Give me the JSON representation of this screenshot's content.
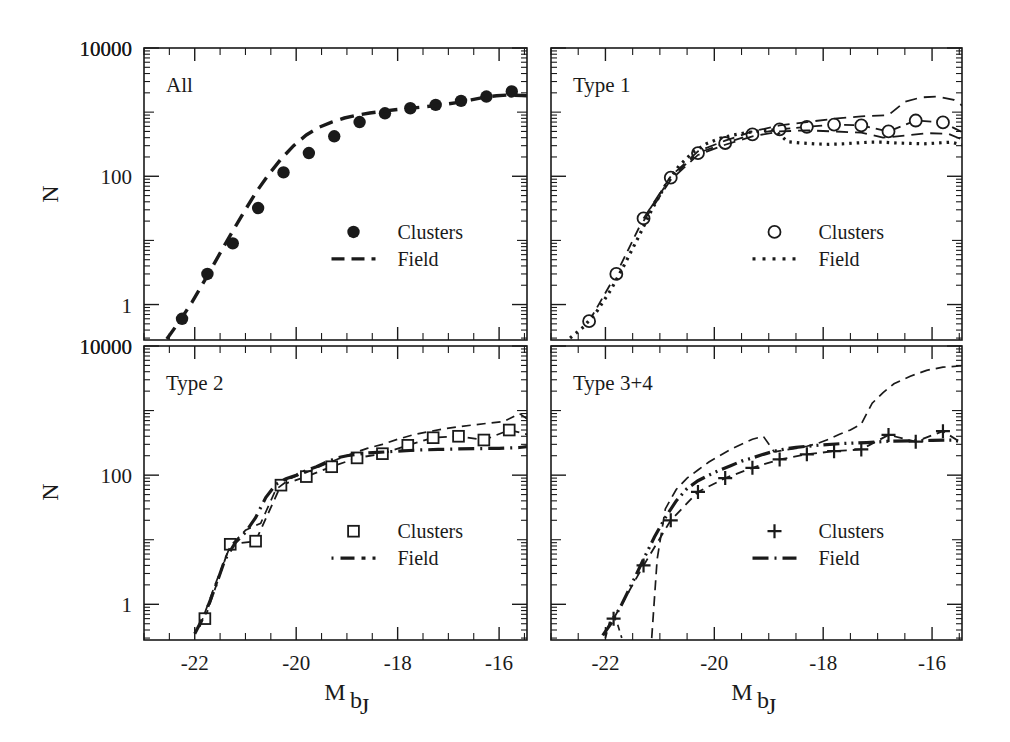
{
  "figure": {
    "title": "",
    "background": "#ffffff",
    "ink_color": "#1a1a1a",
    "width": 1010,
    "height": 742
  },
  "axes": {
    "xlabel_main": "M",
    "xlabel_sub": "b",
    "xlabel_subsub": "J",
    "ylabel": "N",
    "x_ticks": [
      "-22",
      "-20",
      "-18",
      "-16"
    ],
    "x_tick_values": [
      -22,
      -20,
      -18,
      -16
    ],
    "y_ticks": [
      "10000",
      "100",
      "1"
    ],
    "y_tick_values": [
      10000,
      100,
      1
    ],
    "y_top_label": "10000",
    "xlim": [
      -23.0,
      -15.45
    ],
    "ylim": [
      0.28,
      10000
    ],
    "yscale": "log",
    "xscale": "linear",
    "grid": false
  },
  "legend_labels": {
    "clusters": "Clusters",
    "field": "Field"
  },
  "chart_data": {
    "type": "line",
    "xlabel": "M_bJ",
    "ylabel": "N",
    "xlim": [
      -23.0,
      -15.45
    ],
    "ylim": [
      0.28,
      10000
    ],
    "yscale": "log",
    "grid": false,
    "legend_position": "center-right inside each panel",
    "panels": [
      {
        "id": "all",
        "label": "All",
        "position": "top-left",
        "series": [
          {
            "name": "Clusters",
            "kind": "scatter",
            "marker": "filled-circle",
            "x": [
              -22.25,
              -21.75,
              -21.25,
              -20.75,
              -20.25,
              -19.75,
              -19.25,
              -18.75,
              -18.25,
              -17.75,
              -17.25,
              -16.75,
              -16.25,
              -15.75,
              -15.25
            ],
            "y": [
              0.6,
              3.0,
              9.0,
              32.0,
              115.0,
              230.0,
              420.0,
              700.0,
              960.0,
              1150.0,
              1300.0,
              1500.0,
              1750.0,
              2100.0,
              2400.0
            ]
          },
          {
            "name": "Field",
            "kind": "line",
            "linestyle": "dashed",
            "dasharray": "14,8",
            "linewidth": 3.4,
            "x": [
              -22.55,
              -22.3,
              -22.05,
              -21.8,
              -21.55,
              -21.3,
              -21.05,
              -20.8,
              -20.55,
              -20.3,
              -20.05,
              -19.8,
              -19.55,
              -19.3,
              -19.05,
              -18.8,
              -18.55,
              -18.3,
              -18.05,
              -17.8,
              -17.55,
              -17.3,
              -17.05,
              -16.8,
              -16.55,
              -16.3,
              -16.05,
              -15.8,
              -15.55,
              -15.3
            ],
            "y": [
              0.29,
              0.55,
              1.1,
              2.4,
              5.4,
              12.0,
              26.0,
              55.0,
              105.0,
              185.0,
              300.0,
              440.0,
              580.0,
              700.0,
              810.0,
              900.0,
              970.0,
              1030.0,
              1090.0,
              1140.0,
              1190.0,
              1250.0,
              1330.0,
              1420.0,
              1550.0,
              1700.0,
              1800.0,
              1850.0,
              1820.0,
              1780.0
            ]
          }
        ]
      },
      {
        "id": "type1",
        "label": "Type 1",
        "position": "top-right",
        "series": [
          {
            "name": "Clusters",
            "kind": "scatter-line",
            "marker": "open-circle",
            "linestyle": "dashed",
            "dasharray": "10,6",
            "linewidth": 1.8,
            "x": [
              -22.3,
              -21.8,
              -21.3,
              -20.8,
              -20.3,
              -19.8,
              -19.3,
              -18.8,
              -18.3,
              -17.8,
              -17.3,
              -16.8,
              -16.3,
              -15.8,
              -15.3
            ],
            "y": [
              0.55,
              3.0,
              22.0,
              95.0,
              230.0,
              330.0,
              450.0,
              540.0,
              590.0,
              640.0,
              620.0,
              500.0,
              740.0,
              690.0,
              420.0
            ]
          },
          {
            "name": "Field",
            "kind": "line",
            "linestyle": "dotted",
            "dasharray": "2.5,5",
            "linewidth": 3.2,
            "x": [
              -22.65,
              -22.4,
              -22.15,
              -21.9,
              -21.65,
              -21.4,
              -21.15,
              -20.9,
              -20.65,
              -20.4,
              -20.15,
              -19.9,
              -19.65,
              -19.4,
              -19.15,
              -18.9,
              -18.65,
              -18.4,
              -18.15,
              -17.9,
              -17.65,
              -17.4,
              -17.15,
              -16.9,
              -16.65,
              -16.4,
              -16.15,
              -15.9,
              -15.65,
              -15.4,
              -15.25
            ],
            "y": [
              0.3,
              0.45,
              0.8,
              1.7,
              4.2,
              11.0,
              30.0,
              72.0,
              145.0,
              235.0,
              320.0,
              390.0,
              440.0,
              480.0,
              510.0,
              530.0,
              345.0,
              330.0,
              320.0,
              315.0,
              320.0,
              330.0,
              340.0,
              340.0,
              330.0,
              325.0,
              320.0,
              330.0,
              340.0,
              300.0,
              220.0
            ]
          },
          {
            "name": "Field-upper-envelope",
            "kind": "line",
            "linestyle": "dashed",
            "dasharray": "12,7",
            "linewidth": 1.8,
            "x": [
              -21.3,
              -20.8,
              -20.3,
              -19.8,
              -19.3,
              -18.8,
              -18.3,
              -17.8,
              -17.3,
              -16.8,
              -16.5,
              -16.2,
              -15.9,
              -15.6,
              -15.3
            ],
            "y": [
              22.0,
              100.0,
              245.0,
              360.0,
              500.0,
              620.0,
              700.0,
              790.0,
              860.0,
              900.0,
              1450.0,
              1700.0,
              1750.0,
              1550.0,
              1050.0
            ]
          },
          {
            "name": "Field-lower-envelope",
            "kind": "line",
            "linestyle": "dashed",
            "dasharray": "12,7",
            "linewidth": 1.8,
            "x": [
              -21.3,
              -20.8,
              -20.3,
              -19.8,
              -19.3,
              -18.8,
              -18.3,
              -17.8,
              -17.3,
              -16.9,
              -16.5,
              -16.1,
              -15.7,
              -15.3
            ],
            "y": [
              20.0,
              88.0,
              215.0,
              310.0,
              420.0,
              500.0,
              520.0,
              500.0,
              480.0,
              400.0,
              430.0,
              470.0,
              460.0,
              330.0
            ]
          }
        ]
      },
      {
        "id": "type2",
        "label": "Type 2",
        "position": "bottom-left",
        "series": [
          {
            "name": "Clusters",
            "kind": "scatter-line",
            "marker": "open-square",
            "linestyle": "dashed",
            "dasharray": "9,6",
            "linewidth": 1.8,
            "x": [
              -21.8,
              -21.3,
              -20.8,
              -20.3,
              -19.8,
              -19.3,
              -18.8,
              -18.3,
              -17.8,
              -17.3,
              -16.8,
              -16.3,
              -15.8,
              -15.3
            ],
            "y": [
              0.6,
              8.5,
              9.5,
              70.0,
              95.0,
              135.0,
              185.0,
              215.0,
              290.0,
              380.0,
              400.0,
              350.0,
              500.0,
              400.0
            ]
          },
          {
            "name": "Field",
            "kind": "line",
            "linestyle": "dash-dot",
            "dasharray": "16,6,2,6",
            "linewidth": 3.2,
            "x": [
              -22.0,
              -21.8,
              -21.6,
              -21.4,
              -21.2,
              -21.0,
              -20.8,
              -20.6,
              -20.4,
              -20.2,
              -20.0,
              -19.8,
              -19.6,
              -19.4,
              -19.2,
              -19.0,
              -18.8,
              -18.6,
              -18.4,
              -18.2,
              -18.0,
              -17.6,
              -17.2,
              -16.8,
              -16.4,
              -16.0,
              -15.6,
              -15.3
            ],
            "y": [
              0.35,
              0.7,
              1.8,
              5.0,
              9.0,
              13.0,
              22.0,
              45.0,
              72.0,
              88.0,
              100.0,
              118.0,
              135.0,
              160.0,
              185.0,
              200.0,
              210.0,
              220.0,
              225.0,
              230.0,
              235.0,
              245.0,
              250.0,
              255.0,
              258.0,
              260.0,
              268.0,
              285.0
            ]
          },
          {
            "name": "Clusters-upper-envelope",
            "kind": "line",
            "linestyle": "dashed",
            "dasharray": "9,6",
            "linewidth": 1.7,
            "x": [
              -21.9,
              -21.6,
              -21.3,
              -21.0,
              -20.7,
              -20.4,
              -20.1,
              -19.8,
              -19.5,
              -19.2,
              -18.9,
              -18.6,
              -18.3,
              -18.0,
              -17.7,
              -17.4,
              -17.1,
              -16.8,
              -16.5,
              -16.2,
              -15.9,
              -15.6,
              -15.3
            ],
            "y": [
              0.45,
              2.0,
              8.0,
              14.0,
              18.0,
              60.0,
              90.0,
              110.0,
              140.0,
              175.0,
              215.0,
              260.0,
              300.0,
              360.0,
              420.0,
              470.0,
              520.0,
              560.0,
              600.0,
              640.0,
              680.0,
              900.0,
              620.0
            ]
          }
        ]
      },
      {
        "id": "type34",
        "label": "Type 3+4",
        "position": "bottom-right",
        "series": [
          {
            "name": "Clusters",
            "kind": "scatter-line",
            "marker": "plus",
            "linestyle": "dashed",
            "dasharray": "9,6",
            "linewidth": 1.8,
            "x": [
              -21.85,
              -21.3,
              -20.8,
              -20.3,
              -19.8,
              -19.3,
              -18.8,
              -18.3,
              -17.8,
              -17.3,
              -16.8,
              -16.3,
              -15.8,
              -15.3
            ],
            "y": [
              0.6,
              4.0,
              20.0,
              55.0,
              90.0,
              130.0,
              175.0,
              210.0,
              235.0,
              250.0,
              420.0,
              330.0,
              480.0,
              260.0
            ]
          },
          {
            "name": "Field",
            "kind": "line",
            "linestyle": "dash-dot-dot",
            "dasharray": "16,5,2,5,2,5",
            "linewidth": 3.2,
            "x": [
              -22.05,
              -21.9,
              -21.7,
              -21.5,
              -21.3,
              -21.1,
              -20.9,
              -20.7,
              -20.5,
              -20.3,
              -20.1,
              -19.9,
              -19.7,
              -19.5,
              -19.3,
              -19.1,
              -18.9,
              -18.7,
              -18.5,
              -18.3,
              -18.0,
              -17.6,
              -17.2,
              -16.8,
              -16.4,
              -16.0,
              -15.6,
              -15.3
            ],
            "y": [
              0.33,
              0.5,
              1.0,
              2.2,
              5.0,
              11.0,
              22.0,
              40.0,
              62.0,
              82.0,
              100.0,
              120.0,
              140.0,
              165.0,
              185.0,
              210.0,
              235.0,
              255.0,
              270.0,
              280.0,
              295.0,
              310.0,
              320.0,
              335.0,
              340.0,
              345.0,
              350.0,
              300.0
            ]
          },
          {
            "name": "Field-upper-envelope",
            "kind": "line",
            "linestyle": "dashed",
            "dasharray": "10,6",
            "linewidth": 1.7,
            "x": [
              -21.15,
              -21.05,
              -20.9,
              -20.7,
              -20.5,
              -20.3,
              -20.1,
              -19.9,
              -19.7,
              -19.5,
              -19.3,
              -19.1,
              -18.9,
              -18.7,
              -18.5,
              -18.3,
              -18.1,
              -17.9,
              -17.7,
              -17.5,
              -17.3,
              -17.1,
              -16.9,
              -16.7,
              -16.4,
              -16.1,
              -15.8,
              -15.5,
              -15.35
            ],
            "y": [
              0.3,
              5.0,
              30.0,
              60.0,
              90.0,
              120.0,
              160.0,
              200.0,
              250.0,
              300.0,
              360.0,
              400.0,
              230.0,
              245.0,
              260.0,
              280.0,
              310.0,
              360.0,
              430.0,
              500.0,
              620.0,
              1300.0,
              1900.0,
              2600.0,
              3400.0,
              4200.0,
              4700.0,
              4900.0,
              4900.0
            ]
          },
          {
            "name": "Clusters-faint-tail",
            "kind": "line",
            "linestyle": "dashed",
            "dasharray": "6,5",
            "linewidth": 1.7,
            "x": [
              -22.0,
              -21.92,
              -21.85,
              -21.78,
              -21.7
            ],
            "y": [
              0.3,
              0.55,
              0.65,
              0.5,
              0.3
            ]
          }
        ]
      }
    ]
  },
  "panel_legend_styles": {
    "all": {
      "marker": "filled-circle",
      "line": "dashed"
    },
    "type1": {
      "marker": "open-circle",
      "line": "dotted"
    },
    "type2": {
      "marker": "open-square",
      "line": "dash-dot"
    },
    "type34": {
      "marker": "plus",
      "line": "dash-dot-dot"
    }
  }
}
